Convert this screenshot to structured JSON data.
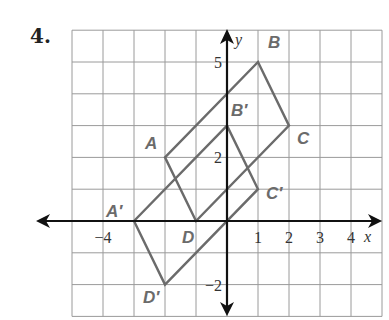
{
  "problem_number": "4.",
  "grid": {
    "x_min": -5,
    "x_max": 5,
    "y_min": -3,
    "y_max": 6
  },
  "axes": {
    "x_label": "x",
    "y_label": "y",
    "x_ticks": [
      {
        "value": -4,
        "label": "−4"
      },
      {
        "value": 1,
        "label": "1"
      },
      {
        "value": 2,
        "label": "2"
      },
      {
        "value": 3,
        "label": "3"
      },
      {
        "value": 4,
        "label": "4"
      }
    ],
    "y_ticks": [
      {
        "value": 5,
        "label": "5"
      },
      {
        "value": 2,
        "label": "2"
      },
      {
        "value": -2,
        "label": "−2"
      }
    ]
  },
  "figures": [
    {
      "name": "ABCD",
      "vertices": [
        {
          "label": "A",
          "x": -2,
          "y": 2
        },
        {
          "label": "B",
          "x": 1,
          "y": 5
        },
        {
          "label": "C",
          "x": 2,
          "y": 3
        },
        {
          "label": "D",
          "x": -1,
          "y": 0
        }
      ]
    },
    {
      "name": "A'B'C'D'",
      "vertices": [
        {
          "label": "A′",
          "x": -3,
          "y": 0
        },
        {
          "label": "B′",
          "x": 0,
          "y": 3
        },
        {
          "label": "C′",
          "x": 1,
          "y": 1
        },
        {
          "label": "D′",
          "x": -2,
          "y": -2
        }
      ]
    }
  ],
  "colors": {
    "shape": "#6b6b6b",
    "grid": "#9a9a9a",
    "axis": "#111111"
  }
}
